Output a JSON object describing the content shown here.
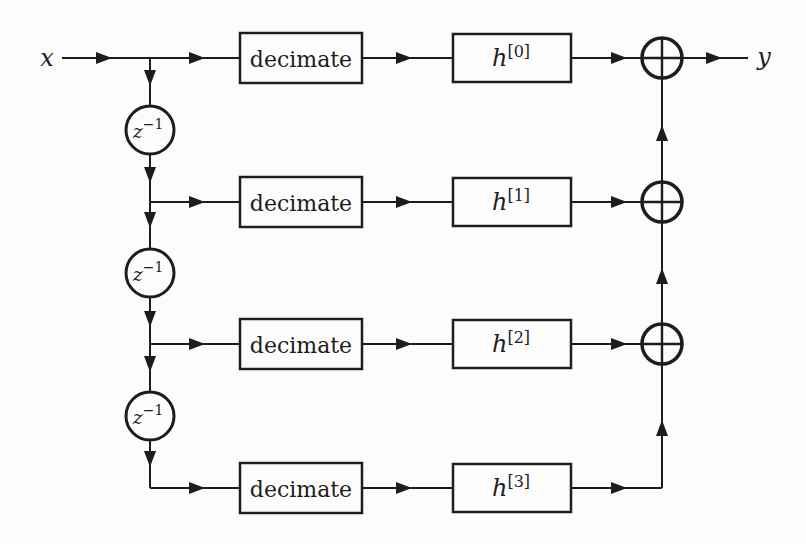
{
  "diagram": {
    "type": "block-diagram",
    "input_label": "x",
    "output_label": "y",
    "delay_label": {
      "base": "z",
      "exponent": "−1"
    },
    "rows": [
      {
        "process_label": "decimate",
        "filter_base": "h",
        "filter_exponent": "[0]"
      },
      {
        "process_label": "decimate",
        "filter_base": "h",
        "filter_exponent": "[1]"
      },
      {
        "process_label": "decimate",
        "filter_base": "h",
        "filter_exponent": "[2]"
      },
      {
        "process_label": "decimate",
        "filter_base": "h",
        "filter_exponent": "[3]"
      }
    ],
    "adder_symbol": "plus-in-circle"
  },
  "colors": {
    "line": "#1d1d1d",
    "background": "#fcfcfc"
  }
}
